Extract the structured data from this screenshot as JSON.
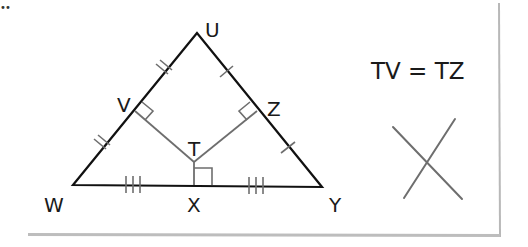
{
  "diagram": {
    "type": "geometry",
    "colors": {
      "triangle_stroke": "#111111",
      "bisector_stroke": "#6e6e6e",
      "tick_stroke": "#6e6e6e",
      "card_shadow": "#b5b5b5",
      "background": "#ffffff"
    },
    "corner_mark": "••",
    "vertices": {
      "U": {
        "label": "U",
        "x": 197,
        "y": 33
      },
      "W": {
        "label": "W",
        "x": 73,
        "y": 185
      },
      "Y": {
        "label": "Y",
        "x": 322,
        "y": 187
      }
    },
    "points": {
      "V": {
        "label": "V",
        "x": 135,
        "y": 111
      },
      "Z": {
        "label": "Z",
        "x": 257,
        "y": 111
      },
      "T": {
        "label": "T",
        "x": 194,
        "y": 162
      },
      "X": {
        "label": "X",
        "x": 194,
        "y": 185
      }
    },
    "segments": [
      {
        "from": "U",
        "to": "W",
        "style": "triangle"
      },
      {
        "from": "U",
        "to": "Y",
        "style": "triangle"
      },
      {
        "from": "W",
        "to": "Y",
        "style": "triangle"
      },
      {
        "from": "T",
        "to": "V",
        "style": "bisector"
      },
      {
        "from": "T",
        "to": "Z",
        "style": "bisector"
      },
      {
        "from": "T",
        "to": "X",
        "style": "bisector"
      }
    ],
    "tick_marks": [
      {
        "segment": "UV",
        "count": 2
      },
      {
        "segment": "VW",
        "count": 2
      },
      {
        "segment": "UZ",
        "count": 1
      },
      {
        "segment": "ZY",
        "count": 1
      },
      {
        "segment": "WX",
        "count": 3
      },
      {
        "segment": "XY",
        "count": 3
      }
    ],
    "right_angles": [
      "V",
      "Z",
      "X"
    ],
    "equation": "TV = TZ",
    "cross_mark": {
      "meaning": "cross-out",
      "line1": {
        "x1": 393,
        "y1": 127,
        "x2": 462,
        "y2": 199
      },
      "line2": {
        "x1": 455,
        "y1": 119,
        "x2": 404,
        "y2": 198
      }
    }
  }
}
